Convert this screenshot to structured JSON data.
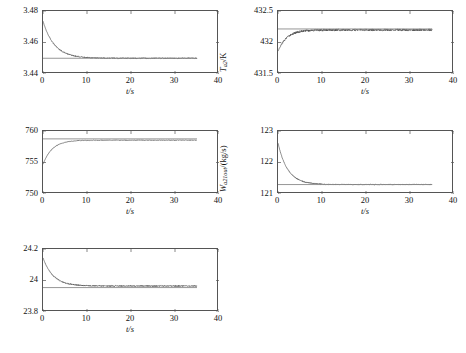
{
  "figure": {
    "panel_count": 5,
    "background": "#ffffff",
    "curve_color": "#4a4a4a",
    "reference_line_color": "#8a8a8a",
    "axis_color": "#555555"
  },
  "chart_data": [
    {
      "id": "p-a2",
      "type": "line",
      "title": "",
      "xlabel": "t/s",
      "ylabel": "P_a2 / x10^5 Pa",
      "ylabel_symbol": "P",
      "ylabel_subscript": "a2",
      "ylabel_unit": "/×10⁵ Pa",
      "xlim": [
        0,
        40
      ],
      "ylim": [
        3.44,
        3.48
      ],
      "xticks": [
        0,
        10,
        20,
        30,
        40
      ],
      "xticklabels": [
        "0",
        "10",
        "20",
        "30",
        "40"
      ],
      "yticks": [
        3.44,
        3.46,
        3.48
      ],
      "yticklabels": [
        "3.44",
        "3.46",
        "3.48"
      ],
      "grid": false,
      "legend": "none",
      "data_xmax": 35,
      "series": [
        {
          "name": "response",
          "shape": "exponential-decay",
          "y_start": 3.4735,
          "y_final": 3.45,
          "tau": 2.6,
          "noise": 0.00035
        },
        {
          "name": "reference",
          "shape": "horizontal",
          "y": 3.45
        }
      ]
    },
    {
      "id": "t-a2",
      "type": "line",
      "title": "",
      "xlabel": "t/s",
      "ylabel": "T_a2 / K",
      "ylabel_symbol": "T",
      "ylabel_subscript": "a2",
      "ylabel_unit": "/K",
      "xlim": [
        0,
        40
      ],
      "ylim": [
        431.5,
        432.5
      ],
      "xticks": [
        0,
        10,
        20,
        30,
        40
      ],
      "xticklabels": [
        "0",
        "10",
        "20",
        "30",
        "40"
      ],
      "yticks": [
        431.5,
        432.0,
        432.5
      ],
      "yticklabels": [
        "431.5",
        "432",
        "432.5"
      ],
      "grid": false,
      "legend": "none",
      "data_xmax": 35,
      "series": [
        {
          "name": "response",
          "shape": "exponential-rise",
          "y_start": 431.86,
          "y_final": 432.2,
          "tau": 2.0,
          "noise": 0.017
        },
        {
          "name": "reference",
          "shape": "horizontal",
          "y": 432.215
        }
      ]
    },
    {
      "id": "t-a1",
      "type": "line",
      "title": "",
      "xlabel": "t/s",
      "ylabel": "T_a1 / K",
      "ylabel_symbol": "T",
      "ylabel_subscript": "a1",
      "ylabel_unit": "/K",
      "xlim": [
        0,
        40
      ],
      "ylim": [
        750,
        760
      ],
      "xticks": [
        0,
        10,
        20,
        30,
        40
      ],
      "xticklabels": [
        "0",
        "10",
        "20",
        "30",
        "40"
      ],
      "yticks": [
        750,
        755,
        760
      ],
      "yticklabels": [
        "750",
        "755",
        "760"
      ],
      "grid": false,
      "legend": "none",
      "data_xmax": 35,
      "series": [
        {
          "name": "response",
          "shape": "exponential-rise",
          "y_start": 754.7,
          "y_final": 758.55,
          "tau": 2.1,
          "noise": 0.045
        },
        {
          "name": "reference",
          "shape": "horizontal",
          "y": 758.75
        }
      ]
    },
    {
      "id": "w-a21out",
      "type": "line",
      "title": "",
      "xlabel": "t/s",
      "ylabel": "W_a21out / (kg/s)",
      "ylabel_symbol": "W",
      "ylabel_subscript": "a21out",
      "ylabel_unit": "/(kg/s)",
      "xlim": [
        0,
        40
      ],
      "ylim": [
        121,
        123
      ],
      "xticks": [
        0,
        10,
        20,
        30,
        40
      ],
      "xticklabels": [
        "0",
        "10",
        "20",
        "30",
        "40"
      ],
      "yticks": [
        121,
        122,
        123
      ],
      "yticklabels": [
        "121",
        "122",
        "123"
      ],
      "grid": false,
      "legend": "none",
      "data_xmax": 35,
      "series": [
        {
          "name": "response",
          "shape": "exponential-decay",
          "y_start": 122.62,
          "y_final": 121.3,
          "tau": 2.2,
          "noise": 0.016
        },
        {
          "name": "reference",
          "shape": "horizontal",
          "y": 121.3
        }
      ]
    },
    {
      "id": "w-a1out",
      "type": "line",
      "title": "",
      "xlabel": "t/s",
      "ylabel": "W_a1out / (kg/s)",
      "ylabel_symbol": "W",
      "ylabel_subscript": "a1out",
      "ylabel_unit": "/(kg/s)",
      "xlim": [
        0,
        40
      ],
      "ylim": [
        23.8,
        24.2
      ],
      "xticks": [
        0,
        10,
        20,
        30,
        40
      ],
      "xticklabels": [
        "0",
        "10",
        "20",
        "30",
        "40"
      ],
      "yticks": [
        23.8,
        24.0,
        24.2
      ],
      "yticklabels": [
        "23.8",
        "24",
        "24.2"
      ],
      "grid": false,
      "legend": "none",
      "data_xmax": 35,
      "series": [
        {
          "name": "response",
          "shape": "exponential-decay",
          "y_start": 24.145,
          "y_final": 23.965,
          "tau": 2.3,
          "noise": 0.0035
        },
        {
          "name": "reference",
          "shape": "horizontal",
          "y": 23.955
        }
      ]
    }
  ]
}
